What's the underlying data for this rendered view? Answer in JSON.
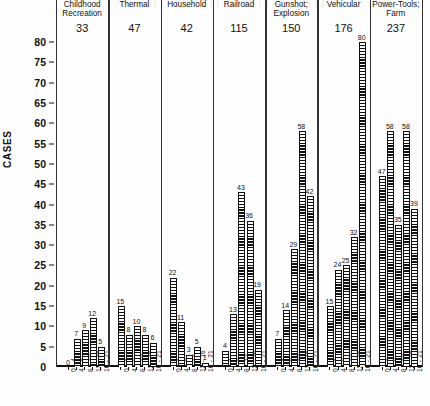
{
  "chart_data": {
    "type": "bar",
    "title": "",
    "xlabel": "",
    "ylabel": "CASES",
    "ylim": [
      0,
      80
    ],
    "ytick_step": 5,
    "yticks": [
      0,
      5,
      10,
      15,
      20,
      25,
      30,
      35,
      40,
      45,
      50,
      55,
      60,
      65,
      70,
      75,
      80
    ],
    "grid": false,
    "legend": "none",
    "categories": [
      "0 - 4",
      "4 - 8",
      "8 - 12",
      "12 - 16",
      "16 - 21"
    ],
    "category_units": "years",
    "panels": [
      {
        "name": "Childhood\nRecreation",
        "total": "33",
        "values": [
          0,
          7,
          9,
          12,
          5
        ]
      },
      {
        "name": "Thermal",
        "total": "47",
        "values": [
          15,
          8,
          10,
          8,
          6
        ]
      },
      {
        "name": "Household",
        "total": "42",
        "values": [
          22,
          11,
          3,
          5,
          1
        ]
      },
      {
        "name": "Railroad",
        "total": "115",
        "values": [
          4,
          13,
          43,
          36,
          19
        ]
      },
      {
        "name": "Gunshot;\nExplosion",
        "total": "150",
        "values": [
          7,
          14,
          29,
          58,
          42
        ]
      },
      {
        "name": "Vehicular",
        "total": "176",
        "values": [
          15,
          24,
          25,
          32,
          80
        ]
      },
      {
        "name": "Power-Tools;\nFarm",
        "total": "237",
        "values": [
          47,
          58,
          35,
          58,
          39
        ]
      }
    ]
  },
  "style": {
    "axis_color": "#111111",
    "bar_fill": "#111111",
    "background": "#fefefe"
  }
}
